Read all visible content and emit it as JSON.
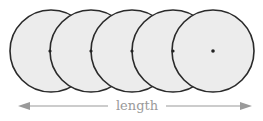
{
  "diagram": {
    "label": "length",
    "circle_count": 5,
    "colors": {
      "circle_fill": "#ececec",
      "circle_stroke": "#2a2a2a",
      "center_dot": "#222222",
      "arrow": "#9a9a9a",
      "label": "#9a9a9a"
    }
  }
}
